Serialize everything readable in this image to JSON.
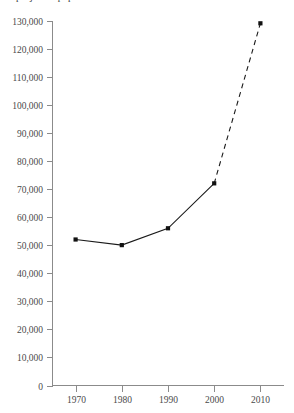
{
  "clipped_title": "projected population",
  "chart_data": {
    "type": "line",
    "title": "",
    "xlabel": "",
    "ylabel": "",
    "x": [
      1970,
      1980,
      1990,
      2000,
      2010
    ],
    "categories": [
      "1970",
      "1980",
      "1990",
      "2000",
      "2010"
    ],
    "values": [
      52000,
      50000,
      56000,
      72000,
      129000
    ],
    "series": [
      {
        "name": "actual",
        "style": "solid",
        "x": [
          1970,
          1980,
          1990,
          2000
        ],
        "values": [
          52000,
          50000,
          56000,
          72000
        ]
      },
      {
        "name": "projected",
        "style": "dashed",
        "x": [
          2000,
          2010
        ],
        "values": [
          72000,
          129000
        ]
      }
    ],
    "xlim": [
      1965,
      2015
    ],
    "ylim": [
      0,
      130000
    ],
    "x_tick_labels": [
      "1970",
      "1980",
      "1990",
      "2000",
      "2010"
    ],
    "y_tick_labels": [
      "0",
      "10,000",
      "20,000",
      "30,000",
      "40,000",
      "50,000",
      "60,000",
      "70,000",
      "80,000",
      "90,000",
      "100,000",
      "110,000",
      "120,000",
      "130,000"
    ],
    "y_tick_values": [
      0,
      10000,
      20000,
      30000,
      40000,
      50000,
      60000,
      70000,
      80000,
      90000,
      100000,
      110000,
      120000,
      130000
    ],
    "grid": false,
    "legend": "none",
    "marker": "square",
    "line_color": "#111111",
    "axis_color": "#8b8b8b",
    "background_color": "#ffffff"
  }
}
